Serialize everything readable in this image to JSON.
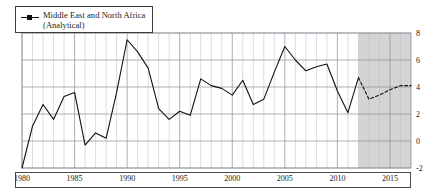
{
  "legend": {
    "entries": [
      {
        "label": "Middle East and North Africa\n(Analytical)",
        "marker": "square-line-marker",
        "color": "#111111"
      }
    ]
  },
  "colors": {
    "line": "#111111",
    "grid": "#b9b9c4",
    "grid_major": "#8c8c99",
    "forecast_band": "#cccccc",
    "axis": "#4a4a4a",
    "background": "#ffffff"
  },
  "chart_data": {
    "type": "line",
    "title": "",
    "subtitle": "",
    "xlabel": "",
    "ylabel": "",
    "xlim": [
      1980,
      2017
    ],
    "ylim": [
      -2,
      8
    ],
    "ytick_values": [
      8,
      6,
      4,
      2,
      0,
      -2
    ],
    "ytick_labels": [
      "8",
      "6",
      "4",
      "2",
      "0",
      "-2"
    ],
    "xtick_values": [
      1980,
      1985,
      1990,
      1995,
      2000,
      2005,
      2010,
      2015
    ],
    "xtick_labels": [
      "1980",
      "1985",
      "1990",
      "1995",
      "2000",
      "2005",
      "2010",
      "2015"
    ],
    "grid": "both",
    "grid_x_step": 1,
    "grid_y_step": 2,
    "legend_position": "top-left",
    "forecast_start": 2012,
    "forecast_end": 2017,
    "forecast_shading_label": "projection-band",
    "series": [
      {
        "name": "Middle East and North Africa (Analytical)",
        "style": "solid",
        "x": [
          1980,
          1981,
          1982,
          1983,
          1984,
          1985,
          1986,
          1987,
          1988,
          1989,
          1990,
          1991,
          1992,
          1993,
          1994,
          1995,
          1996,
          1997,
          1998,
          1999,
          2000,
          2001,
          2002,
          2003,
          2004,
          2005,
          2006,
          2007,
          2008,
          2009,
          2010,
          2011,
          2012
        ],
        "values": [
          -2.0,
          1.1,
          2.7,
          1.6,
          3.3,
          3.6,
          -0.3,
          0.6,
          0.2,
          3.6,
          7.5,
          6.6,
          5.4,
          2.4,
          1.6,
          2.2,
          1.9,
          4.6,
          4.1,
          3.9,
          3.4,
          4.5,
          2.7,
          3.1,
          5.1,
          7.0,
          6.0,
          5.2,
          5.5,
          5.7,
          3.7,
          2.1,
          4.7
        ]
      },
      {
        "name": "Middle East and North Africa (Analytical) projection",
        "style": "dashed",
        "x": [
          2012,
          2013,
          2014,
          2015,
          2016,
          2017
        ],
        "values": [
          4.7,
          3.1,
          3.4,
          3.8,
          4.1,
          4.1
        ]
      }
    ]
  }
}
